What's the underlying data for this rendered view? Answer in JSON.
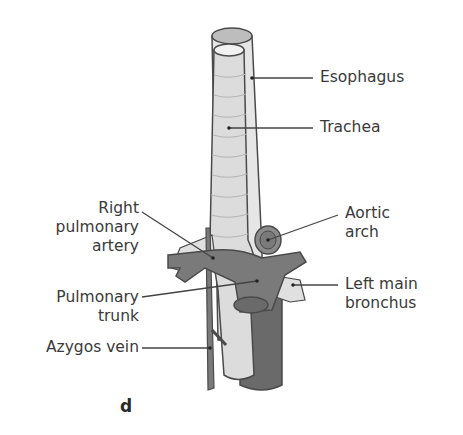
{
  "figure": {
    "panel_letter": "d",
    "colors": {
      "trachea": "#dcdcdc",
      "esophagus": "#e6e6e6",
      "vessel_dark": "#7a7a7a",
      "vessel_darker": "#6a6a6a",
      "outline": "#4a4a4a",
      "leader": "#444444",
      "label_text": "#3a3a3a"
    }
  },
  "labels": {
    "esophagus": "Esophagus",
    "trachea": "Trachea",
    "right_pulmonary_artery": [
      "Right",
      "pulmonary",
      "artery"
    ],
    "aortic_arch": [
      "Aortic",
      "arch"
    ],
    "pulmonary_trunk": [
      "Pulmonary",
      "trunk"
    ],
    "left_main_bronchus": [
      "Left main",
      "bronchus"
    ],
    "azygos_vein": "Azygos vein"
  }
}
